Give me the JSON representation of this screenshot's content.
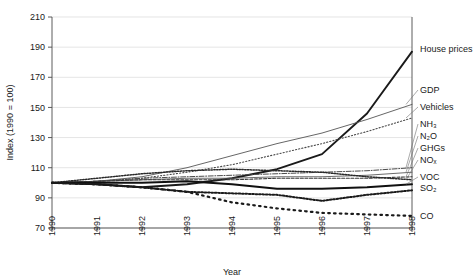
{
  "chart_data": {
    "type": "line",
    "title": "",
    "xlabel": "Year",
    "ylabel": "Index (1990 = 100)",
    "x": [
      1990,
      1991,
      1992,
      1993,
      1994,
      1995,
      1996,
      1997,
      1998
    ],
    "xtick_labels": [
      "1990",
      "1991",
      "1992",
      "1993",
      "1994",
      "1995",
      "1996",
      "1997",
      "1998"
    ],
    "ytick_labels": [
      "70",
      "90",
      "110",
      "130",
      "150",
      "170",
      "190",
      "210"
    ],
    "ytick_values": [
      70,
      90,
      110,
      130,
      150,
      170,
      190,
      210
    ],
    "ylim": [
      70,
      210
    ],
    "xlim": [
      1990,
      1998
    ],
    "grid": true,
    "legend_position": "right-inline-labels",
    "series": [
      {
        "name": "House prices",
        "label": "House prices",
        "style": "solid-thick",
        "color": "#1a1a1a",
        "values": [
          100,
          99,
          97,
          99,
          103,
          109,
          119,
          146,
          187
        ]
      },
      {
        "name": "GDP",
        "label": "GDP",
        "style": "solid-thin",
        "color": "#555555",
        "values": [
          100,
          101,
          104,
          110,
          118,
          126,
          133,
          142,
          152
        ]
      },
      {
        "name": "Vehicles",
        "label": "Vehicles",
        "style": "dotted-fine",
        "color": "#4a4a4a",
        "values": [
          100,
          101,
          103,
          107,
          112,
          119,
          126,
          134,
          143
        ]
      },
      {
        "name": "NH3",
        "label": "NH₃",
        "style": "dash-dot",
        "color": "#4a4a4a",
        "values": [
          100,
          101,
          103,
          104,
          105,
          106,
          107,
          108,
          110
        ]
      },
      {
        "name": "N2O",
        "label": "N₂O",
        "style": "solid-thin",
        "color": "#5a5a5a",
        "values": [
          100,
          101,
          102,
          103,
          103,
          104,
          104,
          105,
          107
        ]
      },
      {
        "name": "GHGs",
        "label": "GHGs",
        "style": "dash-short",
        "color": "#3a3a3a",
        "values": [
          100,
          101,
          102,
          102,
          102,
          103,
          103,
          103,
          104
        ]
      },
      {
        "name": "NOx",
        "label": "NOₓ",
        "style": "dotted-dense",
        "color": "#2a2a2a",
        "values": [
          100,
          103,
          106,
          108,
          109,
          108,
          107,
          104,
          102
        ]
      },
      {
        "name": "VOC",
        "label": "VOC",
        "style": "solid-thick",
        "color": "#111111",
        "values": [
          100,
          100,
          100,
          101,
          99,
          96,
          96,
          97,
          99
        ]
      },
      {
        "name": "SO2",
        "label": "SO₂",
        "style": "dotted-bold",
        "color": "#1a1a1a",
        "values": [
          100,
          99,
          97,
          94,
          93,
          92,
          88,
          92,
          95
        ]
      },
      {
        "name": "CO",
        "label": "CO",
        "style": "dotted-sparse",
        "color": "#1a1a1a",
        "values": [
          100,
          99,
          97,
          94,
          87,
          83,
          80,
          79,
          78
        ]
      }
    ]
  }
}
